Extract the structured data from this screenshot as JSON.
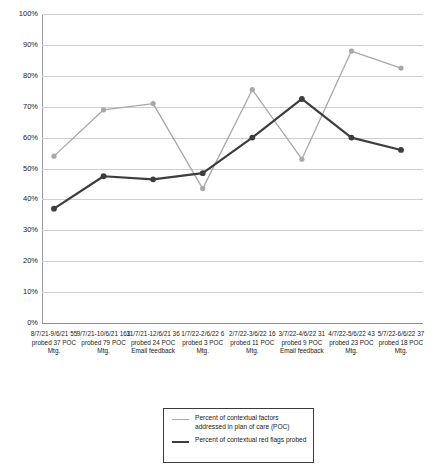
{
  "chart_data": {
    "type": "line",
    "title": "",
    "xlabel": "",
    "ylabel": "",
    "ylim": [
      0,
      100
    ],
    "grid": true,
    "legend_position": "bottom-center",
    "y_ticks": [
      "100%",
      "90%",
      "80%",
      "70%",
      "60%",
      "50%",
      "40%",
      "30%",
      "20%",
      "10%",
      "0%"
    ],
    "y_tick_values": [
      100,
      90,
      80,
      70,
      60,
      50,
      40,
      30,
      20,
      10,
      0
    ],
    "categories": [
      "8/7/21-9/6/21 55 probed 37 POC Mtg.",
      "9/7/21-10/6/21 163 probed 79 POC Mtg.",
      "11/7/21-12/6/21 36 probed 24 POC Email feedback",
      "1/7/22-2/6/22 6 probed 3 POC Mtg.",
      "2/7/22-3/6/22 16 probed 11 POC Mtg.",
      "3/7/22-4/6/22 31 probed 9 POC Email feedback",
      "4/7/22-5/6/22 43 probed 23 POC Mtg.",
      "5/7/22-6/6/22 37 probed 18 POC Mtg."
    ],
    "series": [
      {
        "name": "Percent of contextual factors addressed in plan of care (POC)",
        "color": "#a8a8a8",
        "values": [
          54,
          69,
          71,
          43.5,
          75.5,
          53,
          88,
          82.5
        ]
      },
      {
        "name": "Percent of contextual red flags probed",
        "color": "#3d3d3d",
        "values": [
          37,
          47.5,
          46.5,
          48.5,
          60,
          72.5,
          60,
          56
        ]
      }
    ]
  },
  "legend": {
    "items": [
      {
        "label": "Percent of contextual factors addressed in plan of care (POC)",
        "style": "thin"
      },
      {
        "label": "Percent of contextual red flags probed",
        "style": "thick"
      }
    ]
  },
  "colors": {
    "series_light": "#a8a8a8",
    "series_dark": "#3d3d3d",
    "gridline": "#cfcfcf",
    "axis": "#8c8c8c",
    "text": "#1a1a1a",
    "background": "#ffffff"
  }
}
